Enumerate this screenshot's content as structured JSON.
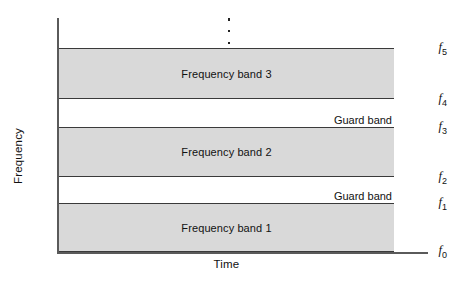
{
  "figure": {
    "axes": {
      "y_title": "Frequency",
      "x_title": "Time"
    },
    "ellipsis": "vertical-ellipsis",
    "colors": {
      "band_fill": "#d9d9d9",
      "band_border": "#3a3a3a",
      "axis": "#5a5a5a",
      "background": "#ffffff",
      "text": "#111111"
    }
  },
  "ticks": [
    {
      "key": "f0",
      "base": "f",
      "sub": "0"
    },
    {
      "key": "f1",
      "base": "f",
      "sub": "1"
    },
    {
      "key": "f2",
      "base": "f",
      "sub": "2"
    },
    {
      "key": "f3",
      "base": "f",
      "sub": "3"
    },
    {
      "key": "f4",
      "base": "f",
      "sub": "4"
    },
    {
      "key": "f5",
      "base": "f",
      "sub": "5"
    }
  ],
  "bands": [
    {
      "label": "Frequency band 1",
      "from": "f0",
      "to": "f1",
      "shaded": true
    },
    {
      "label": "Guard band",
      "from": "f1",
      "to": "f2",
      "shaded": false
    },
    {
      "label": "Frequency band 2",
      "from": "f2",
      "to": "f3",
      "shaded": true
    },
    {
      "label": "Guard band",
      "from": "f3",
      "to": "f4",
      "shaded": false
    },
    {
      "label": "Frequency band 3",
      "from": "f4",
      "to": "f5",
      "shaded": true
    }
  ],
  "chart_data": {
    "type": "bar",
    "title": "",
    "xlabel": "Time",
    "ylabel": "Frequency",
    "grid": false,
    "legend": null,
    "categories": [
      "f0-f1",
      "f1-f2",
      "f2-f3",
      "f3-f4",
      "f4-f5"
    ],
    "series": [
      {
        "name": "Spectrum allocation",
        "values": [
          {
            "band": "Frequency band 1",
            "lower": "f0",
            "upper": "f1",
            "type": "channel"
          },
          {
            "band": "Guard band",
            "lower": "f1",
            "upper": "f2",
            "type": "guard"
          },
          {
            "band": "Frequency band 2",
            "lower": "f2",
            "upper": "f3",
            "type": "channel"
          },
          {
            "band": "Guard band",
            "lower": "f3",
            "upper": "f4",
            "type": "guard"
          },
          {
            "band": "Frequency band 3",
            "lower": "f4",
            "upper": "f5",
            "type": "channel"
          }
        ]
      }
    ],
    "ytick_labels": [
      "f0",
      "f1",
      "f2",
      "f3",
      "f4",
      "f5"
    ],
    "xtick_labels": [],
    "annotations": [
      "⋮"
    ]
  }
}
